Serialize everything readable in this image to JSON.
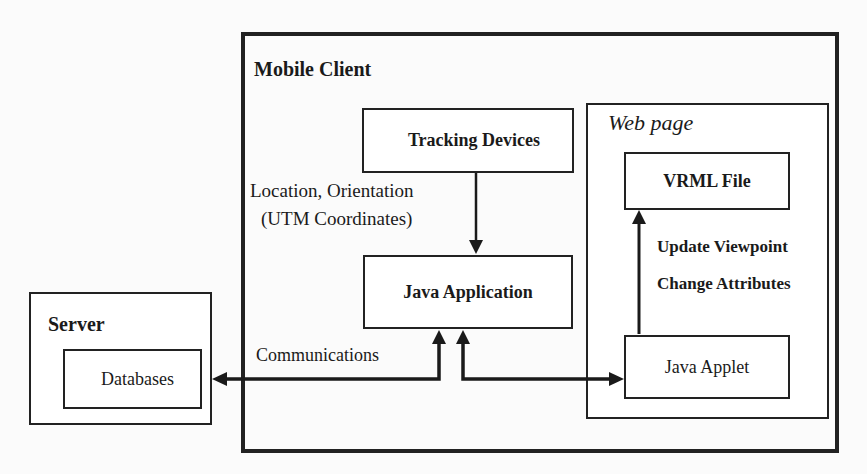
{
  "diagram": {
    "mobile_client": {
      "title": "Mobile Client",
      "tracking_devices": "Tracking Devices",
      "java_application": "Java Application",
      "tracking_to_app_label_line1": "Location, Orientation",
      "tracking_to_app_label_line2": "(UTM Coordinates)",
      "web_page": {
        "title": "Web page",
        "vrml_file": "VRML File",
        "java_applet": "Java Applet",
        "applet_to_vrml_label_line1": "Update Viewpoint",
        "applet_to_vrml_label_line2": "Change Attributes"
      }
    },
    "server": {
      "title": "Server",
      "databases": "Databases"
    },
    "communications_label": "Communications",
    "edges": [
      {
        "from": "Tracking Devices",
        "to": "Java Application",
        "label": "Location, Orientation (UTM Coordinates)",
        "direction": "one-way"
      },
      {
        "from": "Databases",
        "to": "Java Application",
        "label": "Communications",
        "direction": "two-way"
      },
      {
        "from": "Java Application",
        "to": "Java Applet",
        "label": "",
        "direction": "two-way"
      },
      {
        "from": "Java Applet",
        "to": "VRML File",
        "label": "Update Viewpoint / Change Attributes",
        "direction": "one-way"
      }
    ],
    "colors": {
      "stroke": "#222222",
      "background": "#ffffff"
    }
  }
}
